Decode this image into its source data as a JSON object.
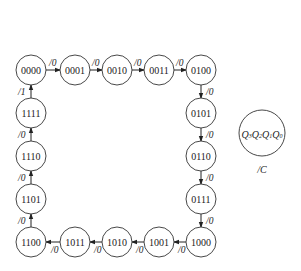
{
  "diagram": {
    "type": "state-transition",
    "states": [
      {
        "id": "s0",
        "label": "0000",
        "cx": 31,
        "cy": 70
      },
      {
        "id": "s1",
        "label": "0001",
        "cx": 75,
        "cy": 70
      },
      {
        "id": "s2",
        "label": "0010",
        "cx": 117,
        "cy": 70
      },
      {
        "id": "s3",
        "label": "0011",
        "cx": 159,
        "cy": 70
      },
      {
        "id": "s4",
        "label": "0100",
        "cx": 201,
        "cy": 70
      },
      {
        "id": "s5",
        "label": "0101",
        "cx": 201,
        "cy": 113
      },
      {
        "id": "s6",
        "label": "0110",
        "cx": 201,
        "cy": 156
      },
      {
        "id": "s7",
        "label": "0111",
        "cx": 201,
        "cy": 199
      },
      {
        "id": "s8",
        "label": "1000",
        "cx": 201,
        "cy": 242
      },
      {
        "id": "s9",
        "label": "1001",
        "cx": 159,
        "cy": 242
      },
      {
        "id": "s10",
        "label": "1010",
        "cx": 117,
        "cy": 242
      },
      {
        "id": "s11",
        "label": "1011",
        "cx": 75,
        "cy": 242
      },
      {
        "id": "s12",
        "label": "1100",
        "cx": 31,
        "cy": 242
      },
      {
        "id": "s13",
        "label": "1101",
        "cx": 31,
        "cy": 199
      },
      {
        "id": "s14",
        "label": "1110",
        "cx": 31,
        "cy": 156
      },
      {
        "id": "s15",
        "label": "1111",
        "cx": 31,
        "cy": 113
      }
    ],
    "transitions": [
      {
        "from": "0000",
        "to": "0001",
        "label": "/0"
      },
      {
        "from": "0001",
        "to": "0010",
        "label": "/0"
      },
      {
        "from": "0010",
        "to": "0011",
        "label": "/0"
      },
      {
        "from": "0011",
        "to": "0100",
        "label": "/0"
      },
      {
        "from": "0100",
        "to": "0101",
        "label": "/0"
      },
      {
        "from": "0101",
        "to": "0110",
        "label": "/0"
      },
      {
        "from": "0110",
        "to": "0111",
        "label": "/0"
      },
      {
        "from": "0111",
        "to": "1000",
        "label": "/0"
      },
      {
        "from": "1000",
        "to": "1001",
        "label": "/0"
      },
      {
        "from": "1001",
        "to": "1010",
        "label": "/0"
      },
      {
        "from": "1010",
        "to": "1011",
        "label": "/0"
      },
      {
        "from": "1011",
        "to": "1100",
        "label": "/0"
      },
      {
        "from": "1100",
        "to": "1101",
        "label": "/0"
      },
      {
        "from": "1101",
        "to": "1110",
        "label": "/0"
      },
      {
        "from": "1110",
        "to": "1111",
        "label": "/0"
      },
      {
        "from": "1111",
        "to": "0000",
        "label": "/1"
      }
    ],
    "legend": {
      "state_label": "Q3Q2Q1Q0",
      "output_label": "/C"
    }
  }
}
